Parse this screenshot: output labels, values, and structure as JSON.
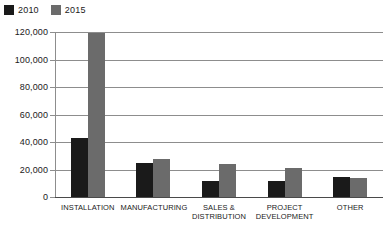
{
  "chart_data": {
    "type": "bar",
    "title": "",
    "xlabel": "",
    "ylabel": "",
    "categories": [
      "INSTALLATION",
      "MANUFACTURING",
      "SALES & DISTRIBUTION",
      "PROJECT DEVELOPMENT",
      "OTHER"
    ],
    "series": [
      {
        "name": "2010",
        "color": "#1a1a1a",
        "values": [
          43000,
          25000,
          12000,
          12000,
          14500
        ]
      },
      {
        "name": "2015",
        "color": "#6b6b6b",
        "values": [
          119000,
          28000,
          24000,
          21000,
          14000
        ]
      }
    ],
    "ylim": [
      0,
      120000
    ],
    "ytick_values": [
      0,
      20000,
      40000,
      60000,
      80000,
      100000,
      120000
    ],
    "ytick_labels": [
      "0",
      "20,000",
      "40,000",
      "60,000",
      "80,000",
      "100,000",
      "120,000"
    ],
    "grid": true,
    "legend_position": "top-left"
  },
  "legend": {
    "entries": [
      {
        "label": "2010",
        "color": "#1a1a1a"
      },
      {
        "label": "2015",
        "color": "#6b6b6b"
      }
    ]
  },
  "categories": {
    "installation": {
      "line1": "INSTALLATION",
      "line2": ""
    },
    "manufacturing": {
      "line1": "MANUFACTURING",
      "line2": ""
    },
    "sales": {
      "line1": "SALES &",
      "line2": "DISTRIBUTION"
    },
    "project": {
      "line1": "PROJECT",
      "line2": "DEVELOPMENT"
    },
    "other": {
      "line1": "OTHER",
      "line2": ""
    }
  }
}
